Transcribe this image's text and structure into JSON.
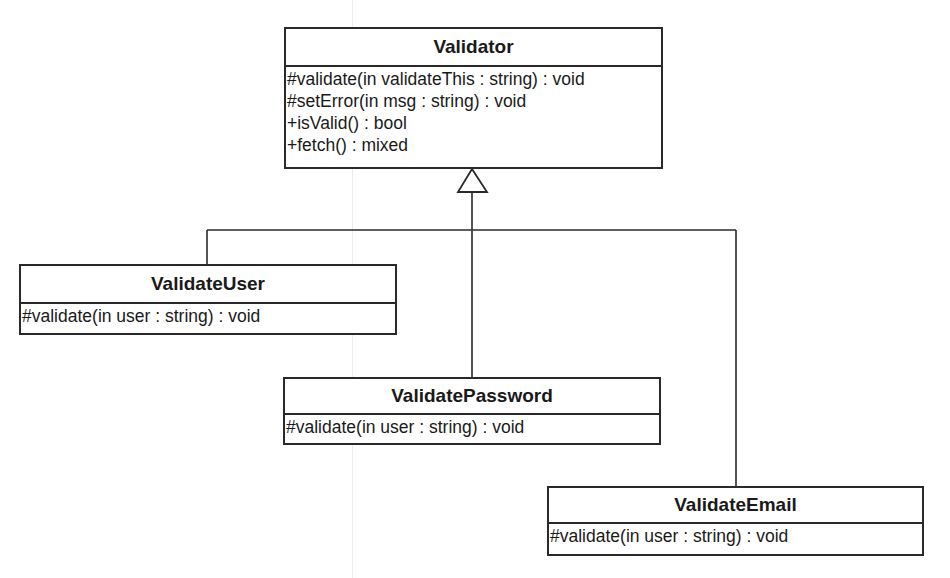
{
  "diagram": {
    "type": "uml-class-diagram",
    "relationship": "generalization",
    "base_class": {
      "name": "Validator",
      "operations": [
        "#validate(in validateThis : string) : void",
        "#setError(in msg : string) : void",
        "+isValid() : bool",
        "+fetch() : mixed"
      ]
    },
    "subclasses": [
      {
        "name": "ValidateUser",
        "operations": [
          "#validate(in user : string) : void"
        ]
      },
      {
        "name": "ValidatePassword",
        "operations": [
          "#validate(in user : string) : void"
        ]
      },
      {
        "name": "ValidateEmail",
        "operations": [
          "#validate(in user : string) : void"
        ]
      }
    ],
    "colors": {
      "stroke": "#2a2a2a",
      "background": "#ffffff",
      "text": "#1a1a1a"
    }
  }
}
